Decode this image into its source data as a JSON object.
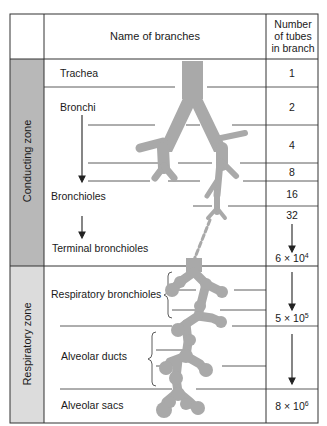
{
  "header": {
    "name_col": "Name of branches",
    "count_col": [
      "Number",
      "of tubes",
      "in branch"
    ]
  },
  "zones": [
    {
      "label": "Conducting zone",
      "color": "#b8b8b8"
    },
    {
      "label": "Respiratory zone",
      "color": "#dcdcdc"
    }
  ],
  "branches": [
    {
      "name": "Trachea"
    },
    {
      "name": "Bronchi"
    },
    {
      "name": "Bronchioles"
    },
    {
      "name": "Terminal bronchioles"
    },
    {
      "name": "Respiratory bronchioles"
    },
    {
      "name": "Alveolar ducts"
    },
    {
      "name": "Alveolar sacs"
    }
  ],
  "counts": [
    {
      "value": "1"
    },
    {
      "value": "2"
    },
    {
      "value": "4"
    },
    {
      "value": "8"
    },
    {
      "value": "16"
    },
    {
      "value": "32"
    },
    {
      "mantissa": "6 × 10",
      "exp": "4"
    },
    {
      "mantissa": "5 × 10",
      "exp": "5"
    },
    {
      "mantissa": "8 × 10",
      "exp": "6"
    }
  ],
  "colors": {
    "airway": "#a9a9a9",
    "line": "#333333",
    "conducting_zone_bg": "#b8b8b8",
    "respiratory_zone_bg": "#dcdcdc"
  }
}
